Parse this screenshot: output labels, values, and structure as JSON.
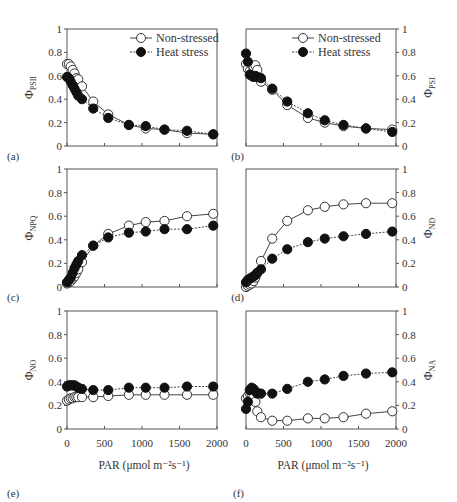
{
  "figure": {
    "x_axis_label": "PAR (μmol m⁻²s⁻¹)",
    "x_ticks": [
      "0",
      "500",
      "1000",
      "1500",
      "2000"
    ],
    "y_ticks": [
      "0",
      "0.2",
      "0.4",
      "0.6",
      "0.8",
      "1"
    ],
    "legend": [
      {
        "label": "Non-stressed",
        "marker": "open-circle",
        "line": "solid"
      },
      {
        "label": "Heat stress",
        "marker": "filled-circle",
        "line": "dashed"
      }
    ],
    "colors": {
      "axis": "#555555",
      "open_fill": "#ffffff",
      "filled": "#111111",
      "line": "#444444"
    }
  },
  "chart_data": [
    {
      "panel": "(a)",
      "type": "line",
      "ylabel": "ΦPSII",
      "ylabel_main": "Φ",
      "ylabel_sub": "PSII",
      "xlabel": "",
      "xlim": [
        0,
        2000
      ],
      "ylim": [
        0,
        1
      ],
      "yaxis_side": "left",
      "x": [
        0,
        25,
        50,
        75,
        100,
        125,
        150,
        200,
        350,
        550,
        825,
        1050,
        1300,
        1600,
        1950
      ],
      "series": [
        {
          "name": "Non-stressed",
          "values": [
            0.7,
            0.7,
            0.68,
            0.65,
            0.62,
            0.58,
            0.57,
            0.51,
            0.38,
            0.27,
            0.18,
            0.15,
            0.14,
            0.11,
            0.1
          ]
        },
        {
          "name": "Heat stress",
          "values": [
            0.59,
            0.58,
            0.55,
            0.52,
            0.49,
            0.46,
            0.43,
            0.4,
            0.32,
            0.24,
            0.18,
            0.17,
            0.14,
            0.13,
            0.1
          ]
        }
      ]
    },
    {
      "panel": "(b)",
      "type": "line",
      "ylabel": "ΦPSI",
      "ylabel_main": "Φ",
      "ylabel_sub": "PSI",
      "xlabel": "",
      "xlim": [
        0,
        2000
      ],
      "ylim": [
        0,
        1
      ],
      "yaxis_side": "right",
      "x": [
        0,
        25,
        50,
        75,
        100,
        125,
        150,
        200,
        350,
        550,
        825,
        1050,
        1300,
        1600,
        1950
      ],
      "series": [
        {
          "name": "Non-stressed",
          "values": [
            0.7,
            0.66,
            0.64,
            0.62,
            0.68,
            0.69,
            0.65,
            0.55,
            0.48,
            0.35,
            0.24,
            0.2,
            0.17,
            0.15,
            0.14
          ]
        },
        {
          "name": "Heat stress",
          "values": [
            0.79,
            0.72,
            0.61,
            0.6,
            0.59,
            0.6,
            0.59,
            0.58,
            0.49,
            0.38,
            0.28,
            0.22,
            0.18,
            0.15,
            0.12
          ]
        }
      ]
    },
    {
      "panel": "(c)",
      "type": "line",
      "ylabel": "ΦNPQ",
      "ylabel_main": "Φ",
      "ylabel_sub": "NPQ",
      "xlabel": "",
      "xlim": [
        0,
        2000
      ],
      "ylim": [
        0,
        1
      ],
      "yaxis_side": "left",
      "x": [
        0,
        25,
        50,
        75,
        100,
        125,
        150,
        200,
        350,
        550,
        825,
        1050,
        1300,
        1600,
        1950
      ],
      "series": [
        {
          "name": "Non-stressed",
          "values": [
            0.03,
            0.04,
            0.05,
            0.07,
            0.09,
            0.12,
            0.15,
            0.21,
            0.35,
            0.45,
            0.52,
            0.55,
            0.56,
            0.6,
            0.62
          ]
        },
        {
          "name": "Heat stress",
          "values": [
            0.04,
            0.06,
            0.08,
            0.12,
            0.16,
            0.19,
            0.22,
            0.27,
            0.35,
            0.42,
            0.46,
            0.47,
            0.49,
            0.49,
            0.52
          ]
        }
      ]
    },
    {
      "panel": "(d)",
      "type": "line",
      "ylabel": "ΦND",
      "ylabel_main": "Φ",
      "ylabel_sub": "ND",
      "xlabel": "",
      "xlim": [
        0,
        2000
      ],
      "ylim": [
        0,
        1
      ],
      "yaxis_side": "right",
      "x": [
        0,
        25,
        50,
        75,
        100,
        125,
        150,
        200,
        350,
        550,
        825,
        1050,
        1300,
        1600,
        1950
      ],
      "series": [
        {
          "name": "Non-stressed",
          "values": [
            0.0,
            0.01,
            0.02,
            0.03,
            0.05,
            0.08,
            0.12,
            0.22,
            0.41,
            0.56,
            0.65,
            0.68,
            0.7,
            0.71,
            0.71
          ]
        },
        {
          "name": "Heat stress",
          "values": [
            0.04,
            0.06,
            0.07,
            0.08,
            0.09,
            0.1,
            0.12,
            0.15,
            0.24,
            0.32,
            0.38,
            0.41,
            0.43,
            0.45,
            0.47
          ]
        }
      ]
    },
    {
      "panel": "(e)",
      "type": "line",
      "ylabel": "ΦNO",
      "ylabel_main": "Φ",
      "ylabel_sub": "NO",
      "xlabel": "PAR (μmol m⁻²s⁻¹)",
      "xlim": [
        0,
        2000
      ],
      "ylim": [
        0,
        1
      ],
      "yaxis_side": "left",
      "x": [
        0,
        25,
        50,
        75,
        100,
        125,
        150,
        200,
        350,
        550,
        825,
        1050,
        1300,
        1600,
        1950
      ],
      "series": [
        {
          "name": "Non-stressed",
          "values": [
            0.24,
            0.25,
            0.26,
            0.26,
            0.27,
            0.27,
            0.27,
            0.27,
            0.27,
            0.28,
            0.29,
            0.29,
            0.29,
            0.29,
            0.29
          ]
        },
        {
          "name": "Heat stress",
          "values": [
            0.36,
            0.37,
            0.37,
            0.37,
            0.37,
            0.36,
            0.35,
            0.34,
            0.33,
            0.33,
            0.35,
            0.35,
            0.35,
            0.36,
            0.36
          ]
        }
      ]
    },
    {
      "panel": "(f)",
      "type": "line",
      "ylabel": "ΦNA",
      "ylabel_main": "Φ",
      "ylabel_sub": "NA",
      "xlabel": "PAR (μmol m⁻²s⁻¹)",
      "xlim": [
        0,
        2000
      ],
      "ylim": [
        0,
        1
      ],
      "yaxis_side": "right",
      "x": [
        0,
        25,
        50,
        75,
        100,
        125,
        150,
        200,
        350,
        550,
        825,
        1050,
        1300,
        1600,
        1950
      ],
      "series": [
        {
          "name": "Non-stressed",
          "values": [
            0.26,
            0.28,
            0.3,
            0.29,
            0.27,
            0.23,
            0.15,
            0.1,
            0.07,
            0.07,
            0.09,
            0.09,
            0.1,
            0.13,
            0.15
          ]
        },
        {
          "name": "Heat stress",
          "values": [
            0.17,
            0.23,
            0.33,
            0.35,
            0.34,
            0.32,
            0.3,
            0.3,
            0.3,
            0.34,
            0.4,
            0.42,
            0.45,
            0.47,
            0.48
          ]
        }
      ]
    }
  ]
}
